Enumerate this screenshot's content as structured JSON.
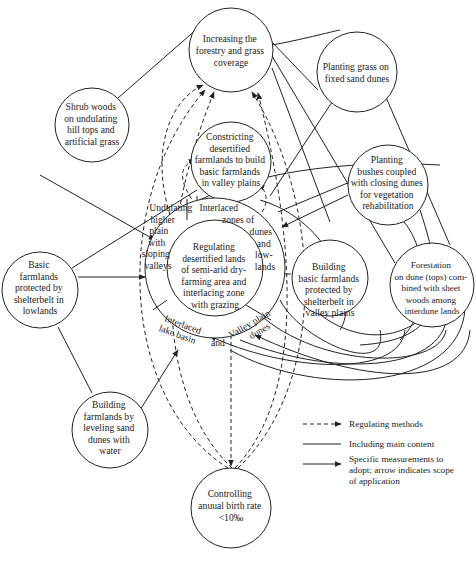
{
  "nodes": {
    "forestry": {
      "lines": [
        "Increasing the",
        "forestry and grass",
        "coverage"
      ]
    },
    "shrub": {
      "lines": [
        "Shrub woods",
        "on undulating",
        "hill tops and",
        "artificial grass"
      ]
    },
    "constricting": {
      "lines": [
        "Constricting",
        "desertified",
        "farmlands to build",
        "basic farmlands",
        "in valley plains"
      ]
    },
    "grass_dunes": {
      "lines": [
        "Planting grass on",
        "fixed sand dunes"
      ]
    },
    "bushes": {
      "lines": [
        "Planting",
        "bushes coupled",
        "with closing dunes",
        "for vegetation",
        "rehabilitation"
      ]
    },
    "lowlands": {
      "lines": [
        "Basic",
        "farmlands",
        "protected by",
        "shelterbelt in",
        "lowlands"
      ]
    },
    "valley_farmlands": {
      "lines": [
        "Building",
        "basic farmlands",
        "protected by",
        "shelterbelt in",
        "valley plains"
      ]
    },
    "forestation": {
      "lines": [
        "Forestation",
        "on dune (tops) com-",
        "bined with sheet",
        "woods among",
        "interdune lands"
      ]
    },
    "leveling": {
      "lines": [
        "Building",
        "farmlands by",
        "leveling sand",
        "dunes with",
        "water"
      ]
    },
    "birth_rate": {
      "lines": [
        "Controlling",
        "anuual birth rate",
        "<10‰"
      ]
    },
    "center": {
      "inner": [
        "Regulating",
        "desertified lands",
        "of semi-arid dry-",
        "farming area and",
        "interlacing zone",
        "with grazing"
      ],
      "undulating": [
        "Undulating",
        "higher",
        "plain",
        "with",
        "sloping",
        "valleys"
      ],
      "interlaced_dunes": [
        "Interlaced",
        "zones of"
      ],
      "dunes_lowlands": [
        "dunes",
        "and",
        "low-",
        "lands"
      ],
      "lake_basin": [
        "Interlaced",
        "lake basin"
      ],
      "and": "and",
      "valley_dunes": [
        "Valley plain",
        "dunes"
      ]
    }
  },
  "legend": {
    "dashed": "Regulating methods",
    "solid": "Including main content",
    "arrow": [
      "Specific measurements to",
      "adopt; arrow indicates scope",
      "of application"
    ]
  },
  "colors": {
    "stroke": "#222222",
    "background": "#ffffff"
  }
}
